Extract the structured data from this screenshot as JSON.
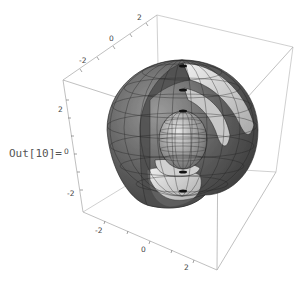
{
  "cell": {
    "output_label": "Out[10]="
  },
  "plot": {
    "type": "3D nested spherical shells with cutaway",
    "top_axis_ticks": [
      "-2",
      "0",
      "2"
    ],
    "left_axis_ticks": [
      "2",
      "0",
      "-2"
    ],
    "bottom_axis_ticks": [
      "-2",
      "0",
      "2"
    ],
    "box_color": "#b8b8b8",
    "surface_dark": "#5a5a5a",
    "surface_light": "#d8d8d8",
    "mesh_color": "#1a1a1a"
  }
}
